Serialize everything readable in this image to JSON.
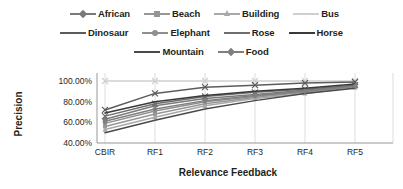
{
  "chart_data": {
    "type": "line",
    "title": "",
    "xlabel": "Relevance Feedback",
    "ylabel": "Precision",
    "categories": [
      "CBIR",
      "RF1",
      "RF2",
      "RF3",
      "RF4",
      "RF5"
    ],
    "ylim": [
      40,
      100
    ],
    "ytick_labels": [
      "100.00%",
      "80.00%",
      "60.00%",
      "40.00%"
    ],
    "ytick_values": [
      100,
      80,
      60,
      40
    ],
    "grid": "vertical",
    "legend_position": "top",
    "value_suffix": "%",
    "series": [
      {
        "name": "African",
        "marker": "diamond",
        "color": "#7a7a7a",
        "values": [
          63,
          76,
          83,
          87,
          91,
          95
        ]
      },
      {
        "name": "Beach",
        "marker": "square",
        "color": "#969696",
        "values": [
          56,
          68,
          78,
          84,
          89,
          94
        ]
      },
      {
        "name": "Building",
        "marker": "triangle",
        "color": "#a8a8a8",
        "values": [
          53,
          65,
          76,
          83,
          88,
          94
        ]
      },
      {
        "name": "Bus",
        "marker": "cross",
        "color": "#cfcfcf",
        "values": [
          100,
          100,
          100,
          100,
          100,
          100
        ]
      },
      {
        "name": "Dinosaur",
        "marker": "cross",
        "color": "#5c5c5c",
        "values": [
          72,
          88,
          94,
          96,
          98,
          99
        ]
      },
      {
        "name": "Elephant",
        "marker": "circle",
        "color": "#8f8f8f",
        "values": [
          59,
          71,
          80,
          85,
          90,
          95
        ]
      },
      {
        "name": "Rose",
        "marker": "cross",
        "color": "#6e6e6e",
        "values": [
          66,
          78,
          85,
          89,
          92,
          96
        ]
      },
      {
        "name": "Horse",
        "marker": "none",
        "color": "#3a3a3a",
        "values": [
          69,
          80,
          86,
          90,
          93,
          97
        ]
      },
      {
        "name": "Mountain",
        "marker": "none",
        "color": "#4a4a4a",
        "values": [
          50,
          62,
          73,
          81,
          88,
          93
        ]
      },
      {
        "name": "Food",
        "marker": "diamond",
        "color": "#7f7f7f",
        "values": [
          61,
          73,
          81,
          86,
          90,
          95
        ]
      }
    ]
  },
  "legend": {
    "rows": [
      [
        "African",
        "Beach",
        "Building",
        "Bus"
      ],
      [
        "Dinosaur",
        "Elephant",
        "Rose",
        "Horse"
      ],
      [
        "Mountain",
        "Food"
      ]
    ]
  },
  "axes": {
    "y_title": "Precision",
    "x_title": "Relevance Feedback"
  }
}
